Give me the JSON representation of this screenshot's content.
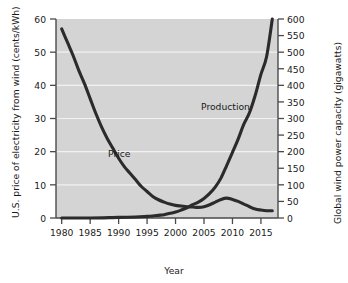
{
  "chart_data": {
    "type": "line",
    "title": "",
    "subtitle": "",
    "xlabel": "Year",
    "ylabel": "U.S. price of electricity from wind (cents/kWh)",
    "ylabel_right": "Global wind power capacity (gigawatts)",
    "xlim": [
      1979,
      2018
    ],
    "ylim": [
      0,
      60
    ],
    "ylim_right": [
      0,
      600
    ],
    "grid": true,
    "grid_orientation": "horizontal",
    "legend_position": "inline-annotation",
    "background_color": "#d4d4d4",
    "gridline_color": "#f2f2f2",
    "line_color": "#2b2b2b",
    "xticks": [
      1980,
      1985,
      1990,
      1995,
      2000,
      2005,
      2010,
      2015
    ],
    "xtick_labels": [
      "1980",
      "1985",
      "1990",
      "1995",
      "2000",
      "2005",
      "2010",
      "2015"
    ],
    "yticks_left": [
      0,
      10,
      20,
      30,
      40,
      50,
      60
    ],
    "ytick_labels_left": [
      "0",
      "10",
      "20",
      "30",
      "40",
      "50",
      "60"
    ],
    "yticks_right": [
      0,
      50,
      100,
      150,
      200,
      250,
      300,
      350,
      400,
      450,
      500,
      550,
      600
    ],
    "ytick_labels_right": [
      "0",
      "50",
      "100",
      "150",
      "200",
      "250",
      "300",
      "350",
      "400",
      "450",
      "500",
      "550",
      "600"
    ],
    "annotations": [
      {
        "text": "Price",
        "x": 1990,
        "y": 25
      },
      {
        "text": "Production",
        "x": 2006,
        "y": 38
      }
    ],
    "series": [
      {
        "name": "Price",
        "axis": "left",
        "unit": "cents/kWh",
        "x": [
          1980,
          1981,
          1982,
          1983,
          1984,
          1985,
          1986,
          1987,
          1988,
          1989,
          1990,
          1991,
          1992,
          1993,
          1994,
          1995,
          1996,
          1997,
          1998,
          1999,
          2000,
          2001,
          2002,
          2003,
          2004,
          2005,
          2006,
          2007,
          2008,
          2009,
          2010,
          2011,
          2012,
          2013,
          2014,
          2015,
          2016,
          2017
        ],
        "values": [
          57,
          53,
          49,
          44.5,
          40.5,
          36,
          31.5,
          27.5,
          24,
          21,
          18,
          15.5,
          13.5,
          11.5,
          9.5,
          8,
          6.5,
          5.5,
          4.8,
          4.2,
          3.8,
          3.6,
          3.4,
          3.3,
          3.2,
          3.4,
          4.0,
          4.8,
          5.6,
          6.0,
          5.6,
          5.0,
          4.2,
          3.4,
          2.7,
          2.4,
          2.2,
          2.2
        ]
      },
      {
        "name": "Production",
        "axis": "right",
        "unit": "gigawatts",
        "x": [
          1980,
          1985,
          1990,
          1993,
          1995,
          1996,
          1997,
          1998,
          1999,
          2000,
          2001,
          2002,
          2003,
          2004,
          2005,
          2006,
          2007,
          2008,
          2009,
          2010,
          2011,
          2012,
          2013,
          2014,
          2015,
          2016,
          2017
        ],
        "values": [
          0,
          0,
          2,
          3,
          5,
          6,
          8,
          10,
          14,
          18,
          24,
          31,
          40,
          48,
          59,
          74,
          94,
          121,
          159,
          198,
          238,
          283,
          318,
          370,
          433,
          487,
          600
        ]
      }
    ]
  },
  "labels": {
    "price": "Price",
    "production": "Production"
  }
}
